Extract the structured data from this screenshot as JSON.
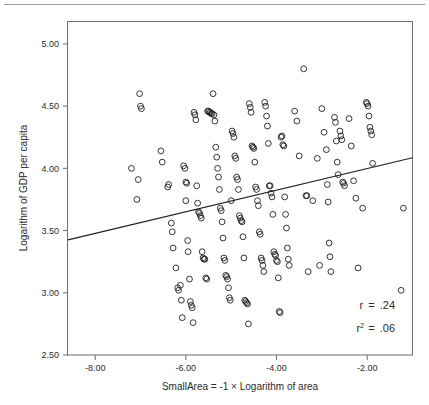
{
  "figure": {
    "has_top_rule": true,
    "background_color": "#ffffff",
    "frame_color": "#6e6e6e",
    "marker_color": "#1f1f1f",
    "line_color": "#1f1f1f"
  },
  "chart_data": {
    "type": "scatter",
    "title": "",
    "xlabel": "SmallArea = -1 × Logarithm of area",
    "ylabel": "Logarithm of GDP per capita",
    "xlim": [
      -8.6,
      -1.0
    ],
    "ylim": [
      2.5,
      5.18
    ],
    "xticks": [
      -8.0,
      -6.0,
      -4.0,
      -2.0
    ],
    "xtick_labels": [
      "-8.00",
      "-6.00",
      "-4.00",
      "-2.00"
    ],
    "yticks": [
      2.5,
      3.0,
      3.5,
      4.0,
      4.5,
      5.0
    ],
    "ytick_labels": [
      "2.50",
      "3.00",
      "3.50",
      "4.00",
      "4.50",
      "5.00"
    ],
    "grid": false,
    "legend": null,
    "marker_style": "open-circle",
    "annotations": [
      {
        "name": "correlation",
        "label": "r",
        "operator": "=",
        "value": ".24",
        "superscript": ""
      },
      {
        "name": "r-squared",
        "label": "r",
        "operator": "=",
        "value": ".06",
        "superscript": "2"
      }
    ],
    "fit_line": {
      "name": "linear-regression-line",
      "x_start": -8.6,
      "y_start": 3.425,
      "x_end": -1.0,
      "y_end": 4.085,
      "slope": 0.0868,
      "intercept": 4.1718
    },
    "points": [
      [
        -7.2,
        4.0
      ],
      [
        -7.02,
        4.6
      ],
      [
        -7.0,
        4.5
      ],
      [
        -6.98,
        4.48
      ],
      [
        -7.05,
        3.91
      ],
      [
        -7.08,
        3.75
      ],
      [
        -6.55,
        4.14
      ],
      [
        -6.52,
        4.05
      ],
      [
        -6.4,
        3.85
      ],
      [
        -6.38,
        3.87
      ],
      [
        -6.32,
        3.56
      ],
      [
        -6.3,
        3.49
      ],
      [
        -6.28,
        3.36
      ],
      [
        -6.22,
        3.2
      ],
      [
        -6.18,
        3.04
      ],
      [
        -6.16,
        3.02
      ],
      [
        -6.12,
        3.06
      ],
      [
        -6.1,
        2.94
      ],
      [
        -6.08,
        2.8
      ],
      [
        -6.05,
        4.02
      ],
      [
        -6.02,
        4.0
      ],
      [
        -6.0,
        3.89
      ],
      [
        -6.0,
        3.74
      ],
      [
        -5.98,
        3.88
      ],
      [
        -5.96,
        3.42
      ],
      [
        -5.95,
        3.33
      ],
      [
        -5.92,
        3.11
      ],
      [
        -5.9,
        2.93
      ],
      [
        -5.88,
        2.9
      ],
      [
        -5.86,
        2.88
      ],
      [
        -5.84,
        2.76
      ],
      [
        -5.82,
        4.45
      ],
      [
        -5.8,
        4.43
      ],
      [
        -5.78,
        4.39
      ],
      [
        -5.76,
        3.86
      ],
      [
        -5.74,
        3.72
      ],
      [
        -5.72,
        3.65
      ],
      [
        -5.7,
        3.64
      ],
      [
        -5.68,
        3.62
      ],
      [
        -5.66,
        3.6
      ],
      [
        -5.64,
        3.33
      ],
      [
        -5.62,
        3.28
      ],
      [
        -5.6,
        3.27
      ],
      [
        -5.58,
        3.27
      ],
      [
        -5.56,
        3.12
      ],
      [
        -5.54,
        3.11
      ],
      [
        -5.52,
        4.46
      ],
      [
        -5.5,
        4.46
      ],
      [
        -5.48,
        4.45
      ],
      [
        -5.46,
        4.45
      ],
      [
        -5.44,
        4.44
      ],
      [
        -5.42,
        4.44
      ],
      [
        -5.4,
        4.6
      ],
      [
        -5.38,
        4.43
      ],
      [
        -5.36,
        4.38
      ],
      [
        -5.34,
        4.17
      ],
      [
        -5.32,
        4.09
      ],
      [
        -5.3,
        4.0
      ],
      [
        -5.28,
        3.93
      ],
      [
        -5.26,
        3.83
      ],
      [
        -5.24,
        3.68
      ],
      [
        -5.22,
        3.66
      ],
      [
        -5.2,
        3.57
      ],
      [
        -5.18,
        3.44
      ],
      [
        -5.16,
        3.28
      ],
      [
        -5.14,
        3.26
      ],
      [
        -5.12,
        3.14
      ],
      [
        -5.1,
        3.13
      ],
      [
        -5.08,
        3.11
      ],
      [
        -5.06,
        3.04
      ],
      [
        -5.04,
        2.96
      ],
      [
        -5.02,
        2.94
      ],
      [
        -5.0,
        3.74
      ],
      [
        -4.98,
        4.3
      ],
      [
        -4.96,
        4.28
      ],
      [
        -4.94,
        4.25
      ],
      [
        -4.92,
        4.1
      ],
      [
        -4.9,
        4.08
      ],
      [
        -4.88,
        3.93
      ],
      [
        -4.86,
        3.91
      ],
      [
        -4.84,
        3.83
      ],
      [
        -4.82,
        3.62
      ],
      [
        -4.8,
        3.6
      ],
      [
        -4.78,
        3.58
      ],
      [
        -4.76,
        3.57
      ],
      [
        -4.74,
        3.45
      ],
      [
        -4.72,
        3.28
      ],
      [
        -4.7,
        2.94
      ],
      [
        -4.68,
        2.93
      ],
      [
        -4.66,
        2.92
      ],
      [
        -4.64,
        2.91
      ],
      [
        -4.62,
        2.75
      ],
      [
        -4.6,
        4.52
      ],
      [
        -4.58,
        4.49
      ],
      [
        -4.56,
        4.45
      ],
      [
        -4.54,
        4.18
      ],
      [
        -4.52,
        4.17
      ],
      [
        -4.5,
        4.16
      ],
      [
        -4.48,
        4.05
      ],
      [
        -4.46,
        3.85
      ],
      [
        -4.44,
        3.83
      ],
      [
        -4.42,
        3.74
      ],
      [
        -4.4,
        3.7
      ],
      [
        -4.38,
        3.49
      ],
      [
        -4.36,
        3.47
      ],
      [
        -4.34,
        3.28
      ],
      [
        -4.32,
        3.26
      ],
      [
        -4.3,
        3.22
      ],
      [
        -4.28,
        3.17
      ],
      [
        -4.26,
        4.53
      ],
      [
        -4.24,
        4.5
      ],
      [
        -4.22,
        4.42
      ],
      [
        -4.2,
        4.34
      ],
      [
        -4.18,
        4.2
      ],
      [
        -4.16,
        3.86
      ],
      [
        -4.14,
        3.86
      ],
      [
        -4.12,
        3.8
      ],
      [
        -4.1,
        3.77
      ],
      [
        -4.08,
        3.63
      ],
      [
        -4.06,
        3.33
      ],
      [
        -4.04,
        3.31
      ],
      [
        -4.02,
        3.3
      ],
      [
        -4.0,
        3.26
      ],
      [
        -3.98,
        3.25
      ],
      [
        -3.96,
        3.12
      ],
      [
        -3.94,
        2.85
      ],
      [
        -3.92,
        2.84
      ],
      [
        -3.9,
        4.25
      ],
      [
        -3.88,
        4.26
      ],
      [
        -3.86,
        4.19
      ],
      [
        -3.84,
        4.18
      ],
      [
        -3.82,
        3.77
      ],
      [
        -3.8,
        3.63
      ],
      [
        -3.78,
        3.52
      ],
      [
        -3.76,
        3.36
      ],
      [
        -3.74,
        3.27
      ],
      [
        -3.72,
        3.22
      ],
      [
        -3.6,
        4.46
      ],
      [
        -3.55,
        4.38
      ],
      [
        -3.5,
        4.1
      ],
      [
        -3.4,
        4.8
      ],
      [
        -3.35,
        3.78
      ],
      [
        -3.33,
        3.78
      ],
      [
        -3.3,
        3.17
      ],
      [
        -3.2,
        3.74
      ],
      [
        -3.1,
        4.08
      ],
      [
        -3.05,
        3.22
      ],
      [
        -3.0,
        4.48
      ],
      [
        -2.95,
        4.29
      ],
      [
        -2.9,
        4.15
      ],
      [
        -2.88,
        3.87
      ],
      [
        -2.86,
        3.73
      ],
      [
        -2.84,
        3.4
      ],
      [
        -2.82,
        3.29
      ],
      [
        -2.8,
        3.17
      ],
      [
        -2.72,
        4.41
      ],
      [
        -2.7,
        4.37
      ],
      [
        -2.68,
        4.22
      ],
      [
        -2.66,
        4.05
      ],
      [
        -2.64,
        3.95
      ],
      [
        -2.6,
        4.3
      ],
      [
        -2.58,
        4.26
      ],
      [
        -2.56,
        4.23
      ],
      [
        -2.54,
        3.89
      ],
      [
        -2.52,
        3.88
      ],
      [
        -2.5,
        3.86
      ],
      [
        -2.4,
        4.4
      ],
      [
        -2.35,
        4.18
      ],
      [
        -2.3,
        3.9
      ],
      [
        -2.25,
        3.76
      ],
      [
        -2.2,
        3.2
      ],
      [
        -2.1,
        3.68
      ],
      [
        -2.02,
        4.53
      ],
      [
        -2.0,
        4.52
      ],
      [
        -1.98,
        4.5
      ],
      [
        -1.96,
        4.42
      ],
      [
        -1.94,
        4.33
      ],
      [
        -1.92,
        4.3
      ],
      [
        -1.9,
        4.27
      ],
      [
        -1.88,
        4.04
      ],
      [
        -1.2,
        3.68
      ],
      [
        -1.25,
        3.02
      ]
    ]
  }
}
